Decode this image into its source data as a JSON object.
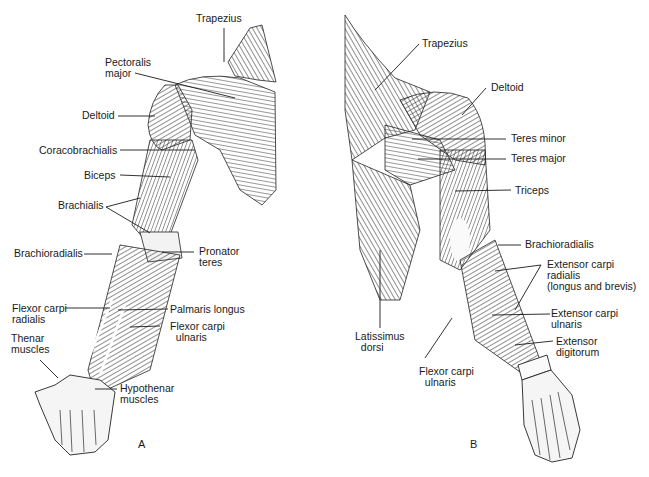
{
  "figure": {
    "panels": [
      {
        "id": "A",
        "letter": "A",
        "view": "anterior",
        "labels": {
          "trapezius": "Trapezius",
          "pectoralis_major": "Pectoralis\nmajor",
          "deltoid": "Deltoid",
          "coracobrachialis": "Coracobrachialis",
          "biceps": "Biceps",
          "brachialis": "Brachialis",
          "brachioradialis": "Brachioradialis",
          "pronator_teres": "Pronator\nteres",
          "flexor_carpi_radialis": "Flexor carpi\nradialis",
          "palmaris_longus": "Palmaris longus",
          "flexor_carpi_ulnaris": "Flexor carpi\n  ulnaris",
          "thenar_muscles": "Thenar\nmuscles",
          "hypothenar_muscles": "Hypothenar\nmuscles"
        }
      },
      {
        "id": "B",
        "letter": "B",
        "view": "posterior",
        "labels": {
          "trapezius": "Trapezius",
          "deltoid": "Deltoid",
          "teres_minor": "Teres minor",
          "teres_major": "Teres major",
          "triceps": "Triceps",
          "brachioradialis": "Brachioradialis",
          "extensor_carpi_radialis": "Extensor carpi\nradialis\n(longus and brevis)",
          "extensor_carpi_ulnaris": "Extensor carpi\nulnaris",
          "extensor_digitorum": "Extensor\ndigitorum",
          "latissimus_dorsi": "Latissimus\n  dorsi",
          "flexor_carpi_ulnaris": "Flexor carpi\n  ulnaris"
        }
      }
    ],
    "colors": {
      "ink": "#1a1a1a",
      "background": "#ffffff",
      "muscle_fill": "#e8e8e8",
      "hatch": "#333333"
    }
  }
}
